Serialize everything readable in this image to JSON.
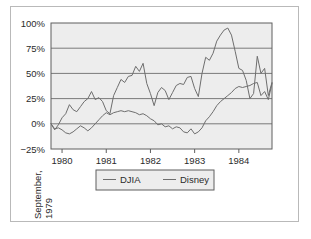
{
  "figure": {
    "frame_color": "#b9b9b9",
    "background": "#ffffff"
  },
  "chart_data": {
    "type": "line",
    "title": "",
    "subtitle": "",
    "xlabel": "September, 1979",
    "ylabel": "",
    "plot_background": "#ededed",
    "grid": true,
    "grid_color": "#7a7a7a",
    "legend_position": "bottom",
    "xlim": [
      0,
      60
    ],
    "ylim": [
      -25,
      100
    ],
    "yticks": [
      -25,
      0,
      25,
      50,
      75,
      100
    ],
    "ytick_labels": [
      "−25%",
      "0%",
      "25%",
      "50%",
      "75%",
      "100%"
    ],
    "xticks": [
      3,
      15,
      27,
      39,
      51
    ],
    "xtick_labels": [
      "1980",
      "1981",
      "1982",
      "1983",
      "1984"
    ],
    "axis_origin_label_line1": "September,",
    "axis_origin_label_line2": "1979",
    "series": [
      {
        "name": "DJIA",
        "color": "#6e6e6e",
        "x": [
          0,
          1,
          2,
          3,
          4,
          5,
          6,
          7,
          8,
          9,
          10,
          11,
          12,
          13,
          14,
          15,
          16,
          17,
          18,
          19,
          20,
          21,
          22,
          23,
          24,
          25,
          26,
          27,
          28,
          29,
          30,
          31,
          32,
          33,
          34,
          35,
          36,
          37,
          38,
          39,
          40,
          41,
          42,
          43,
          44,
          45,
          46,
          47,
          48,
          49,
          50,
          51,
          52,
          53,
          54,
          55,
          56,
          57,
          58,
          59,
          60
        ],
        "values": [
          0,
          -5,
          -4,
          -6,
          -9,
          -10,
          -8,
          -5,
          -2,
          -4,
          -7,
          -4,
          0,
          4,
          8,
          11,
          9,
          11,
          12,
          13,
          12,
          13,
          12,
          11,
          9,
          10,
          8,
          5,
          3,
          -1,
          0,
          -3,
          -2,
          -5,
          -3,
          -4,
          -8,
          -9,
          -5,
          -10,
          -8,
          -4,
          3,
          7,
          12,
          18,
          22,
          25,
          28,
          31,
          35,
          37,
          36,
          37,
          38,
          40,
          41,
          28,
          32,
          24,
          40
        ],
        "label_visible": true
      },
      {
        "name": "Disney",
        "color": "#6e6e6e",
        "x": [
          0,
          1,
          2,
          3,
          4,
          5,
          6,
          7,
          8,
          9,
          10,
          11,
          12,
          13,
          14,
          15,
          16,
          17,
          18,
          19,
          20,
          21,
          22,
          23,
          24,
          25,
          26,
          27,
          28,
          29,
          30,
          31,
          32,
          33,
          34,
          35,
          36,
          37,
          38,
          39,
          40,
          41,
          42,
          43,
          44,
          45,
          46,
          47,
          48,
          49,
          50,
          51,
          52,
          53,
          54,
          55,
          56,
          57,
          58,
          59,
          60
        ],
        "values": [
          0,
          -6,
          -1,
          6,
          10,
          19,
          14,
          12,
          17,
          22,
          25,
          32,
          24,
          26,
          22,
          13,
          10,
          28,
          36,
          44,
          41,
          47,
          48,
          57,
          52,
          60,
          40,
          30,
          18,
          31,
          36,
          33,
          24,
          31,
          38,
          40,
          39,
          46,
          47,
          35,
          27,
          50,
          66,
          63,
          70,
          82,
          88,
          93,
          95,
          88,
          72,
          55,
          53,
          43,
          25,
          30,
          67,
          50,
          55,
          28,
          41
        ],
        "label_visible": true
      }
    ],
    "legend": [
      {
        "label": "DJIA",
        "color": "#6e6e6e"
      },
      {
        "label": "Disney",
        "color": "#6e6e6e"
      }
    ]
  }
}
